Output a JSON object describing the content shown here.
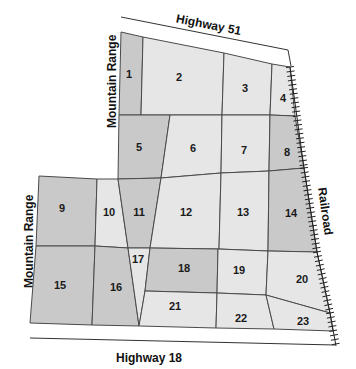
{
  "map": {
    "labels": {
      "highway_top": "Highway 51",
      "highway_bottom": "Highway 18",
      "railroad": "Railroad",
      "mountain_top": "Mountain Range",
      "mountain_bottom": "Mountain Range"
    },
    "colors": {
      "dark_parcel": "#c9c9c9",
      "light_parcel": "#e6e6e6",
      "border": "#4a4a4a"
    },
    "parcels": [
      {
        "id": "1",
        "shade": "dark"
      },
      {
        "id": "2",
        "shade": "light"
      },
      {
        "id": "3",
        "shade": "light"
      },
      {
        "id": "4",
        "shade": "light"
      },
      {
        "id": "5",
        "shade": "dark"
      },
      {
        "id": "6",
        "shade": "light"
      },
      {
        "id": "7",
        "shade": "light"
      },
      {
        "id": "8",
        "shade": "dark"
      },
      {
        "id": "9",
        "shade": "dark"
      },
      {
        "id": "10",
        "shade": "light"
      },
      {
        "id": "11",
        "shade": "dark"
      },
      {
        "id": "12",
        "shade": "light"
      },
      {
        "id": "13",
        "shade": "light"
      },
      {
        "id": "14",
        "shade": "dark"
      },
      {
        "id": "15",
        "shade": "dark"
      },
      {
        "id": "16",
        "shade": "dark"
      },
      {
        "id": "17",
        "shade": "light"
      },
      {
        "id": "18",
        "shade": "dark"
      },
      {
        "id": "19",
        "shade": "light"
      },
      {
        "id": "20",
        "shade": "light"
      },
      {
        "id": "21",
        "shade": "light"
      },
      {
        "id": "22",
        "shade": "light"
      },
      {
        "id": "23",
        "shade": "light"
      }
    ]
  }
}
